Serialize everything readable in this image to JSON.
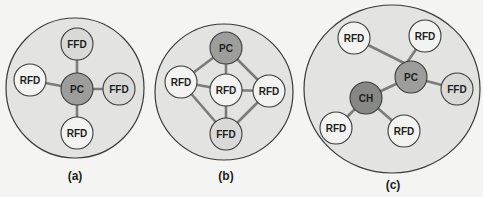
{
  "figure": {
    "colors": {
      "background": "#f4f4f2",
      "cluster_fill": "#e3e3e1",
      "outline": "#3a3a3a",
      "link": "#7c7c7c",
      "rfd_fill": "#f3f3f1",
      "ffd_fill": "#d9d9d7",
      "pc_fill": "#9d9d9b",
      "ch_fill": "#878785"
    },
    "node_radius": 16,
    "panels": [
      {
        "id": "a",
        "label": "(a)",
        "topology": "star",
        "cluster": {
          "cx": 75,
          "cy": 88,
          "rx": 69,
          "ry": 70
        },
        "label_pos": {
          "x": 75,
          "y": 176
        },
        "nodes": [
          {
            "id": "pc",
            "text": "PC",
            "type": "pc",
            "x": 77,
            "y": 89
          },
          {
            "id": "ffd_top",
            "text": "FFD",
            "type": "ffd",
            "x": 77,
            "y": 44
          },
          {
            "id": "ffd_right",
            "text": "FFD",
            "type": "ffd",
            "x": 119,
            "y": 89
          },
          {
            "id": "rfd_left",
            "text": "RFD",
            "type": "rfd",
            "x": 30,
            "y": 80
          },
          {
            "id": "rfd_bottom",
            "text": "RFD",
            "type": "rfd",
            "x": 77,
            "y": 133
          }
        ],
        "links": [
          [
            "pc",
            "ffd_top"
          ],
          [
            "pc",
            "ffd_right"
          ],
          [
            "pc",
            "rfd_left"
          ],
          [
            "pc",
            "rfd_bottom"
          ]
        ]
      },
      {
        "id": "b",
        "label": "(b)",
        "topology": "mesh",
        "cluster": {
          "cx": 224,
          "cy": 92,
          "rx": 69,
          "ry": 68
        },
        "label_pos": {
          "x": 226,
          "y": 176
        },
        "nodes": [
          {
            "id": "pc",
            "text": "PC",
            "type": "pc",
            "x": 226,
            "y": 48
          },
          {
            "id": "rfd_left",
            "text": "RFD",
            "type": "rfd",
            "x": 181,
            "y": 82
          },
          {
            "id": "rfd_center",
            "text": "RFD",
            "type": "rfd",
            "x": 226,
            "y": 90
          },
          {
            "id": "rfd_right",
            "text": "RFD",
            "type": "rfd",
            "x": 269,
            "y": 91
          },
          {
            "id": "ffd_bottom",
            "text": "FFD",
            "type": "ffd",
            "x": 226,
            "y": 134
          }
        ],
        "links": [
          [
            "pc",
            "rfd_left"
          ],
          [
            "pc",
            "rfd_center"
          ],
          [
            "pc",
            "rfd_right"
          ],
          [
            "rfd_left",
            "rfd_center"
          ],
          [
            "rfd_center",
            "rfd_right"
          ],
          [
            "rfd_center",
            "ffd_bottom"
          ],
          [
            "rfd_left",
            "ffd_bottom"
          ],
          [
            "rfd_right",
            "ffd_bottom"
          ]
        ]
      },
      {
        "id": "c",
        "label": "(c)",
        "topology": "cluster-tree",
        "cluster": {
          "cx": 392,
          "cy": 89,
          "rx": 88,
          "ry": 84
        },
        "label_pos": {
          "x": 393,
          "y": 185
        },
        "hub": {
          "x": 406,
          "y": 64
        },
        "nodes": [
          {
            "id": "rfd_tl",
            "text": "RFD",
            "type": "rfd",
            "x": 354,
            "y": 38
          },
          {
            "id": "rfd_tr",
            "text": "RFD",
            "type": "rfd",
            "x": 425,
            "y": 36
          },
          {
            "id": "pc",
            "text": "PC",
            "type": "pc",
            "x": 411,
            "y": 77
          },
          {
            "id": "ffd",
            "text": "FFD",
            "type": "ffd",
            "x": 457,
            "y": 89
          },
          {
            "id": "ch",
            "text": "CH",
            "type": "ch",
            "x": 366,
            "y": 98
          },
          {
            "id": "rfd_bl",
            "text": "RFD",
            "type": "rfd",
            "x": 336,
            "y": 128
          },
          {
            "id": "rfd_br",
            "text": "RFD",
            "type": "rfd",
            "x": 404,
            "y": 131
          }
        ],
        "links": [
          [
            "rfd_tl",
            "hub"
          ],
          [
            "rfd_tr",
            "hub"
          ],
          [
            "hub",
            "pc"
          ],
          [
            "pc",
            "ffd"
          ],
          [
            "pc",
            "ch"
          ],
          [
            "ch",
            "rfd_bl"
          ],
          [
            "ch",
            "rfd_br"
          ]
        ]
      }
    ]
  }
}
